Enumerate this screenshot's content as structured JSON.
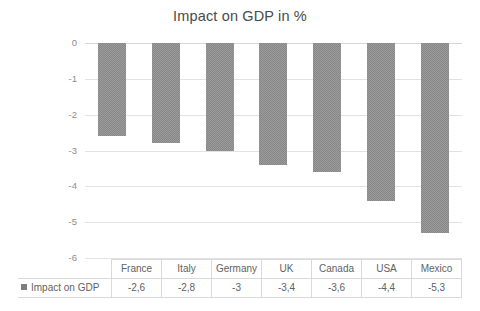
{
  "chart_data": {
    "type": "bar",
    "title": "Impact on GDP in %",
    "xlabel": "",
    "ylabel": "",
    "categories": [
      "France",
      "Italy",
      "Germany",
      "UK",
      "Canada",
      "USA",
      "Mexico"
    ],
    "values": [
      -2.6,
      -2.8,
      -3,
      -3.4,
      -3.6,
      -4.4,
      -5.3
    ],
    "value_labels": [
      "-2,6",
      "-2,8",
      "-3",
      "-3,4",
      "-3,6",
      "-4,4",
      "-5,3"
    ],
    "series": [
      {
        "name": "Impact on GDP",
        "values": [
          -2.6,
          -2.8,
          -3,
          -3.4,
          -3.6,
          -4.4,
          -5.3
        ]
      }
    ],
    "ylim": [
      -6,
      0
    ],
    "y_ticks": [
      0,
      -1,
      -2,
      -3,
      -4,
      -5,
      -6
    ],
    "y_tick_labels": [
      "0",
      "-1",
      "-2",
      "-3",
      "-4",
      "-5",
      "-6"
    ],
    "grid": true,
    "legend_position": "table-row-header",
    "bar_color": "#878787",
    "gridline_color": "#e2e2e2",
    "title_color": "#4a4a4a"
  },
  "legend": {
    "label": "Impact on GDP",
    "swatch_color": "#7f7f7f"
  },
  "table": {
    "row_header": "Impact on GDP",
    "columns": [
      "France",
      "Italy",
      "Germany",
      "UK",
      "Canada",
      "USA",
      "Mexico"
    ],
    "values": [
      "-2,6",
      "-2,8",
      "-3",
      "-3,4",
      "-3,6",
      "-4,4",
      "-5,3"
    ]
  }
}
